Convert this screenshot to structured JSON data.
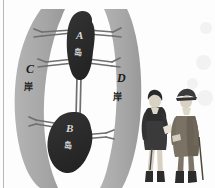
{
  "figure": {
    "title_semantic": "seven-bridges-of-konigsberg-diagram",
    "background_color": "#fdfdfd",
    "bank_color": "#a8a8a8",
    "island_color": "#2b2b2b",
    "bridge_color": "#6f6f6f",
    "label_light_color": "#d8d8d8",
    "label_dark_color": "#1c1c1c"
  },
  "landmasses": [
    {
      "id": "A",
      "letter": "A",
      "kind_label": "岛",
      "type": "island",
      "label_color": "#d8d8d8"
    },
    {
      "id": "B",
      "letter": "B",
      "kind_label": "岛",
      "type": "island",
      "label_color": "#d8d8d8"
    },
    {
      "id": "C",
      "letter": "C",
      "kind_label": "岸",
      "type": "bank",
      "label_color": "#1c1c1c"
    },
    {
      "id": "D",
      "letter": "D",
      "kind_label": "岸",
      "type": "bank",
      "label_color": "#1c1c1c"
    }
  ],
  "bridges": [
    {
      "id": "bridge-1",
      "from": "C",
      "to": "A",
      "position": "upper-left"
    },
    {
      "id": "bridge-2",
      "from": "A",
      "to": "D",
      "position": "upper-right"
    },
    {
      "id": "bridge-3",
      "from": "C",
      "to": "A",
      "position": "mid-left"
    },
    {
      "id": "bridge-4",
      "from": "A",
      "to": "D",
      "position": "mid-right"
    },
    {
      "id": "bridge-5",
      "from": "A",
      "to": "B",
      "position": "center-vertical"
    },
    {
      "id": "bridge-6",
      "from": "C",
      "to": "B",
      "position": "lower-left"
    },
    {
      "id": "bridge-7",
      "from": "B",
      "to": "D",
      "position": "lower-right"
    }
  ],
  "figures": [
    {
      "id": "person-left",
      "description": "standing man in dark coat holding paper"
    },
    {
      "id": "person-right",
      "description": "standing man in tricorn hat with cane"
    }
  ]
}
